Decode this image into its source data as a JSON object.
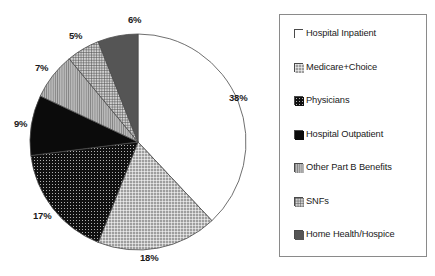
{
  "chart_data": {
    "type": "pie",
    "title": "",
    "legend_position": "right",
    "start_angle_deg": 0,
    "direction": "clockwise",
    "categories": [
      "Hospital Inpatient",
      "Medicare+Choice",
      "Physicians",
      "Hospital Outpatient",
      "Other Part B Benefits",
      "SNFs",
      "Home Health/Hospice"
    ],
    "values": [
      38,
      18,
      17,
      9,
      7,
      5,
      6
    ],
    "value_labels": [
      "38%",
      "18%",
      "17%",
      "9%",
      "7%",
      "5%",
      "6%"
    ],
    "unit": "percent",
    "slices": [
      {
        "label": "Hospital Inpatient",
        "value": 38,
        "value_label": "38%",
        "fill": "white",
        "pattern": "solid-white",
        "color": "#ffffff",
        "label_x": 229,
        "label_y": 92
      },
      {
        "label": "Medicare+Choice",
        "value": 18,
        "value_label": "18%",
        "fill": "fine-grid",
        "pattern": "grid-light",
        "color": "#8f8f8f",
        "label_x": 140,
        "label_y": 252
      },
      {
        "label": "Physicians",
        "value": 17,
        "value_label": "17%",
        "fill": "black-dots",
        "pattern": "dotted-dark",
        "color": "#151515",
        "label_x": 33,
        "label_y": 210
      },
      {
        "label": "Hospital Outpatient",
        "value": 9,
        "value_label": "9%",
        "fill": "solid-black",
        "pattern": "solid-dark",
        "color": "#0d0d0d",
        "label_x": 14,
        "label_y": 118
      },
      {
        "label": "Other Part B Benefits",
        "value": 7,
        "value_label": "7%",
        "fill": "vertical-lines",
        "pattern": "lines-gray",
        "color": "#9a9a9a",
        "label_x": 35,
        "label_y": 62
      },
      {
        "label": "SNFs",
        "value": 5,
        "value_label": "5%",
        "fill": "crosshatch",
        "pattern": "crosshatch-gray",
        "color": "#b0b0b0",
        "label_x": 69,
        "label_y": 30
      },
      {
        "label": "Home Health/Hospice",
        "value": 6,
        "value_label": "6%",
        "fill": "dark-gray",
        "pattern": "solid-midgray",
        "color": "#5c5c5c",
        "label_x": 128,
        "label_y": 14
      }
    ],
    "geometry": {
      "center_x": 138,
      "center_y": 142,
      "radius": 108
    }
  },
  "legend": {
    "items": [
      {
        "label": "Hospital Inpatient",
        "pattern": "solid-white"
      },
      {
        "label": "Medicare+Choice",
        "pattern": "grid-light"
      },
      {
        "label": "Physicians",
        "pattern": "dotted-dark"
      },
      {
        "label": "Hospital Outpatient",
        "pattern": "solid-dark"
      },
      {
        "label": "Other Part B Benefits",
        "pattern": "lines-gray"
      },
      {
        "label": "SNFs",
        "pattern": "crosshatch-gray"
      },
      {
        "label": "Home Health/Hospice",
        "pattern": "solid-midgray"
      }
    ]
  }
}
